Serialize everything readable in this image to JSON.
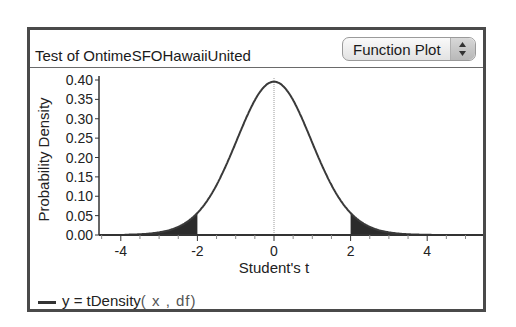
{
  "panel": {
    "title": "Test of OntimeSFOHawaiiUnited",
    "plot_selector": {
      "selected": "Function Plot",
      "icon": "up-down-arrows-icon"
    }
  },
  "legend": {
    "prefix": "y = ",
    "function": "tDensity",
    "args": "( x , df)"
  },
  "colors": {
    "curve": "#3a3a3a",
    "shade": "#2b2b2b",
    "axis": "#333333",
    "frame": "#4a4a4a"
  },
  "chart_data": {
    "type": "line",
    "title": "Test of OntimeSFOHawaiiUnited",
    "xlabel": "Student's t",
    "ylabel": "Probability Density",
    "xlim": [
      -4.55,
      5.5
    ],
    "ylim": [
      0,
      0.415
    ],
    "x_ticks": [
      -4,
      -2,
      0,
      2,
      4
    ],
    "y_ticks": [
      0.0,
      0.05,
      0.1,
      0.15,
      0.2,
      0.25,
      0.3,
      0.35,
      0.4
    ],
    "y_tick_labels": [
      "0.00",
      "0.05",
      "0.10",
      "0.15",
      "0.20",
      "0.25",
      "0.30",
      "0.35",
      "0.40"
    ],
    "grid": false,
    "reference_line_x": 0,
    "series": [
      {
        "name": "y = tDensity(x, df)",
        "function": "tDensity",
        "df": 30,
        "x": [
          -4,
          -3,
          -2.5,
          -2,
          -1.5,
          -1,
          -0.5,
          0,
          0.5,
          1,
          1.5,
          2,
          2.5,
          3,
          4
        ],
        "values": [
          0.0005,
          0.0058,
          0.0185,
          0.0577,
          0.1279,
          0.238,
          0.3486,
          0.3956,
          0.3486,
          0.238,
          0.1279,
          0.0577,
          0.0185,
          0.0058,
          0.0005
        ]
      }
    ],
    "shaded_regions": [
      {
        "from": -4.55,
        "to": -2.0,
        "label": "lower tail"
      },
      {
        "from": 2.0,
        "to": 5.5,
        "label": "upper tail"
      }
    ],
    "legend_position": "bottom-left"
  }
}
